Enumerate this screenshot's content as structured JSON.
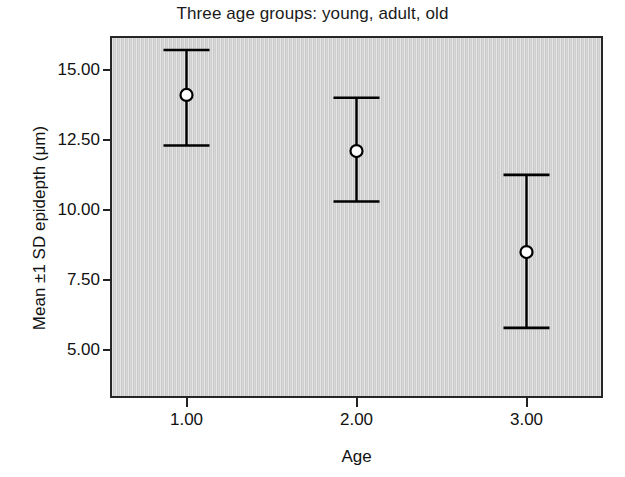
{
  "chart_data": {
    "type": "scatter",
    "title": "Three age groups: young, adult, old",
    "xlabel": "Age",
    "ylabel": "Mean ±1 SD epidepth (μm)",
    "x": [
      1.0,
      2.0,
      3.0
    ],
    "xtick_labels": [
      "1.00",
      "2.00",
      "3.00"
    ],
    "ytick_labels": [
      "5.00",
      "7.50",
      "10.00",
      "12.50",
      "15.00"
    ],
    "ytick_values": [
      5.0,
      7.5,
      10.0,
      12.5,
      15.0
    ],
    "values": [
      14.1,
      12.1,
      8.5
    ],
    "error_low": [
      12.3,
      10.3,
      5.8
    ],
    "error_high": [
      15.7,
      14.0,
      11.25
    ],
    "xlim": [
      0.55,
      3.45
    ],
    "ylim": [
      3.3,
      16.2
    ],
    "grid": false,
    "legend": null,
    "marker": "open-circle",
    "series": [
      {
        "name": "Mean ±1 SD epidepth",
        "points": [
          {
            "x": 1.0,
            "group": "young",
            "mean": 14.1,
            "low": 12.3,
            "high": 15.7
          },
          {
            "x": 2.0,
            "group": "adult",
            "mean": 12.1,
            "low": 10.3,
            "high": 14.0
          },
          {
            "x": 3.0,
            "group": "old",
            "mean": 8.5,
            "low": 5.8,
            "high": 11.25
          }
        ]
      }
    ],
    "colors": {
      "plot_background": "#d2d2d2",
      "axis": "#262626",
      "marker_fill": "#ffffff",
      "marker_stroke": "#000000",
      "errorbar": "#000000",
      "text": "#111111"
    }
  }
}
